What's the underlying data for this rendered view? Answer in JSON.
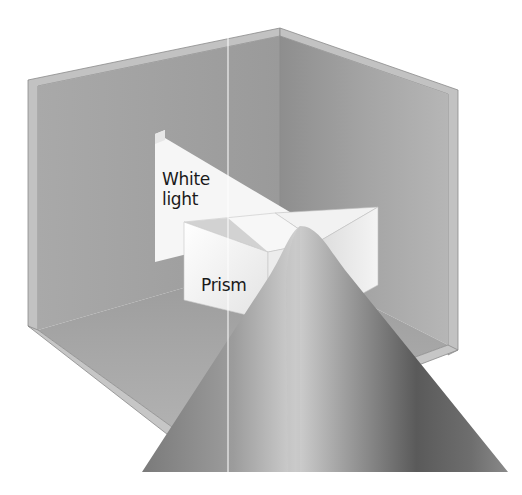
{
  "diagram": {
    "labels": {
      "white_light_line1": "White",
      "white_light_line2": "light",
      "prism": "Prism"
    },
    "colors": {
      "wall": "#9c9c9c",
      "wall_light": "#b5b5b5",
      "floor": "#a8a8a8",
      "beam": "#f4f4f4",
      "prism_face": "#e8e8e8",
      "spectrum_dark": "#555555",
      "spectrum_light": "#c8c8c8"
    }
  }
}
